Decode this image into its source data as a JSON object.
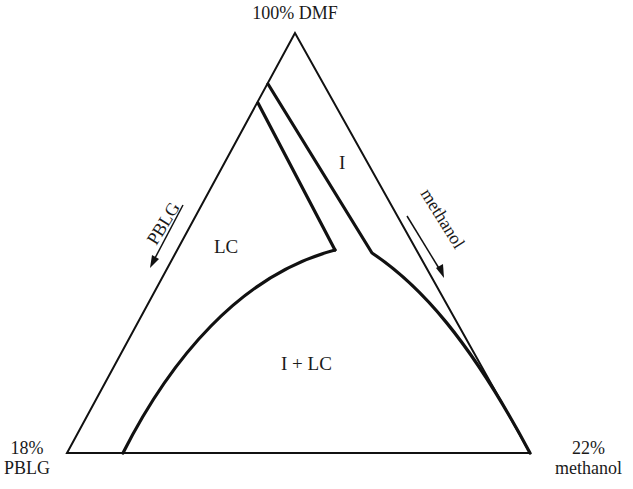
{
  "diagram": {
    "type": "ternary-phase-diagram",
    "vertices": {
      "top": "100% DMF",
      "bottom_left_pct": "18%",
      "bottom_left_name": "PBLG",
      "bottom_right_pct": "22%",
      "bottom_right_name": "methanol"
    },
    "regions": {
      "lc": "LC",
      "i": "I",
      "i_plus_lc": "I + LC"
    },
    "axis_labels": {
      "left": "PBLG",
      "right": "methanol"
    },
    "colors": {
      "line": "#111111",
      "background": "#ffffff",
      "text": "#1a1a1a"
    }
  }
}
